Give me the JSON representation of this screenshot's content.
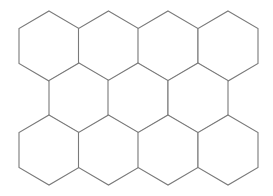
{
  "diagram": {
    "type": "hexagon-grid",
    "orientation": "pointy-top",
    "rows": 3,
    "row_counts": [
      4,
      3,
      4
    ],
    "stroke_color": "#7a7a7a",
    "stroke_width": 1.1,
    "background": "#ffffff",
    "hex": {
      "half_width": 30,
      "top_to_side": 17.5,
      "side_height": 35
    },
    "cells": [
      {
        "row": 0,
        "col": 0,
        "cx": 49,
        "top": 11
      },
      {
        "row": 0,
        "col": 1,
        "cx": 108.5,
        "top": 11
      },
      {
        "row": 0,
        "col": 2,
        "cx": 168,
        "top": 11
      },
      {
        "row": 0,
        "col": 3,
        "cx": 228,
        "top": 11
      },
      {
        "row": 1,
        "col": 0,
        "cx": 79,
        "top": 63
      },
      {
        "row": 1,
        "col": 1,
        "cx": 138,
        "top": 63
      },
      {
        "row": 1,
        "col": 2,
        "cx": 198,
        "top": 63
      },
      {
        "row": 2,
        "col": 0,
        "cx": 49,
        "top": 115
      },
      {
        "row": 2,
        "col": 1,
        "cx": 108.5,
        "top": 115
      },
      {
        "row": 2,
        "col": 2,
        "cx": 168,
        "top": 115
      },
      {
        "row": 2,
        "col": 3,
        "cx": 228,
        "top": 115
      }
    ]
  }
}
